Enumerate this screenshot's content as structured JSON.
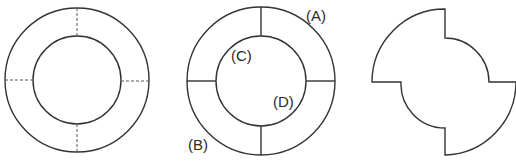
{
  "diagram": {
    "colors": {
      "line": "#333333",
      "background": "#ffffff"
    },
    "figure1": {
      "name": "ring-with-dashed-cuts",
      "cx": 77,
      "cy": 80,
      "r_outer": 72,
      "r_inner": 44
    },
    "figure2": {
      "name": "ring-with-solid-cuts",
      "cx": 261,
      "cy": 81,
      "r_outer": 74,
      "r_inner": 45,
      "labels": [
        {
          "id": "A",
          "text": "(A)",
          "x": 306,
          "y": 21
        },
        {
          "id": "B",
          "text": "(B)",
          "x": 188,
          "y": 150
        },
        {
          "id": "C",
          "text": "(C)",
          "x": 231,
          "y": 61
        },
        {
          "id": "D",
          "text": "(D)",
          "x": 273,
          "y": 107
        }
      ]
    },
    "figure3": {
      "name": "pinwheel-shape",
      "cx": 445,
      "cy": 82,
      "r_outer": 73,
      "r_inner": 44
    }
  }
}
